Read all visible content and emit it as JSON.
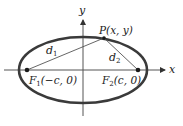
{
  "diagram": {
    "type": "ellipse-foci",
    "colors": {
      "ellipse": "#3a3a3a",
      "axes": "#555555",
      "segments": "#555555",
      "points": "#1a1a1a",
      "text": "#222222"
    },
    "axes": {
      "x_label": "x",
      "y_label": "y"
    },
    "point_p": {
      "label": "P(x, y)"
    },
    "focus_1": {
      "name": "F",
      "sub": "1",
      "coords": "(−c, 0)"
    },
    "focus_2": {
      "name": "F",
      "sub": "2",
      "coords": "(c, 0)"
    },
    "distance_1": {
      "name": "d",
      "sub": "1"
    },
    "distance_2": {
      "name": "d",
      "sub": "2"
    }
  }
}
